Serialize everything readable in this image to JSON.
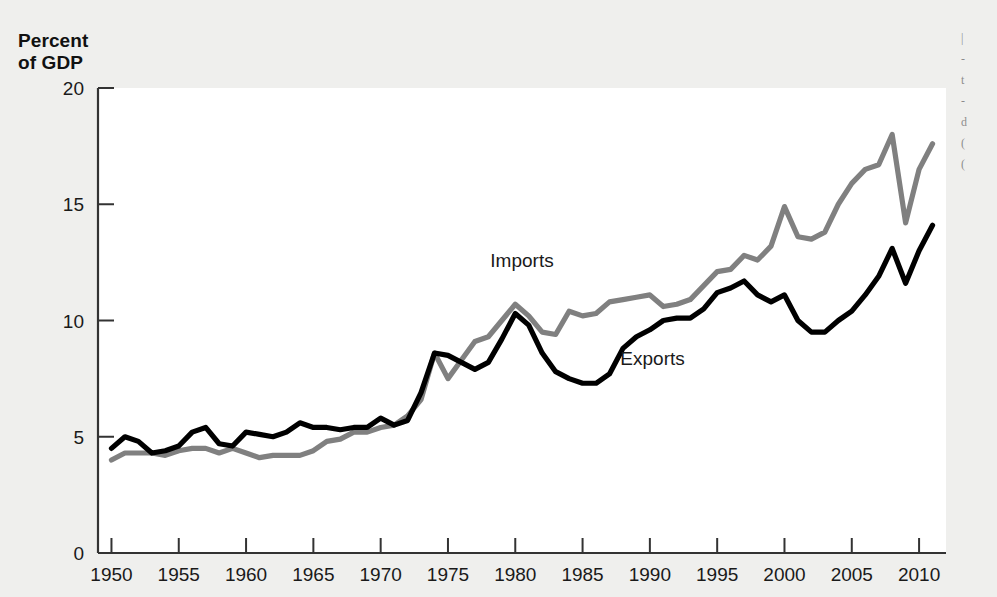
{
  "figure": {
    "axis_title": "Percent\nof GDP",
    "background_color": "#efefed",
    "plot_background_color": "#ffffff"
  },
  "chart_data": {
    "type": "line",
    "title": "",
    "subtitle": "",
    "xlabel": "",
    "ylabel": "Percent of GDP",
    "xlim": [
      1949,
      2012
    ],
    "ylim": [
      0,
      20
    ],
    "grid": false,
    "legend_position": "inline-annotation",
    "xticks": [
      1950,
      1955,
      1960,
      1965,
      1970,
      1975,
      1980,
      1985,
      1990,
      1995,
      2000,
      2005,
      2010
    ],
    "xtick_labels": [
      "1950",
      "1955",
      "1960",
      "1965",
      "1970",
      "1975",
      "1980",
      "1985",
      "1990",
      "1995",
      "2000",
      "2005",
      "2010"
    ],
    "yticks": [
      0,
      5,
      10,
      15,
      20
    ],
    "ytick_labels": [
      "0",
      "5",
      "10",
      "15",
      "20"
    ],
    "x": [
      1950,
      1951,
      1952,
      1953,
      1954,
      1955,
      1956,
      1957,
      1958,
      1959,
      1960,
      1961,
      1962,
      1963,
      1964,
      1965,
      1966,
      1967,
      1968,
      1969,
      1970,
      1971,
      1972,
      1973,
      1974,
      1975,
      1976,
      1977,
      1978,
      1979,
      1980,
      1981,
      1982,
      1983,
      1984,
      1985,
      1986,
      1987,
      1988,
      1989,
      1990,
      1991,
      1992,
      1993,
      1994,
      1995,
      1996,
      1997,
      1998,
      1999,
      2000,
      2001,
      2002,
      2003,
      2004,
      2005,
      2006,
      2007,
      2008,
      2009,
      2010,
      2011
    ],
    "series": [
      {
        "name": "Imports",
        "color": "#808080",
        "label_x": 1980.5,
        "label_y": 12.3,
        "values": [
          4.0,
          4.3,
          4.3,
          4.3,
          4.2,
          4.4,
          4.5,
          4.5,
          4.3,
          4.5,
          4.3,
          4.1,
          4.2,
          4.2,
          4.2,
          4.4,
          4.8,
          4.9,
          5.2,
          5.2,
          5.4,
          5.5,
          5.9,
          6.6,
          8.6,
          7.5,
          8.3,
          9.1,
          9.3,
          10.0,
          10.7,
          10.2,
          9.5,
          9.4,
          10.4,
          10.2,
          10.3,
          10.8,
          10.9,
          11.0,
          11.1,
          10.6,
          10.7,
          10.9,
          11.5,
          12.1,
          12.2,
          12.8,
          12.6,
          13.2,
          14.9,
          13.6,
          13.5,
          13.8,
          15.0,
          15.9,
          16.5,
          16.7,
          18.0,
          14.2,
          16.5,
          17.6
        ]
      },
      {
        "name": "Exports",
        "color": "#000000",
        "label_x": 1990.2,
        "label_y": 8.1,
        "values": [
          4.5,
          5.0,
          4.8,
          4.3,
          4.4,
          4.6,
          5.2,
          5.4,
          4.7,
          4.6,
          5.2,
          5.1,
          5.0,
          5.2,
          5.6,
          5.4,
          5.4,
          5.3,
          5.4,
          5.4,
          5.8,
          5.5,
          5.7,
          6.9,
          8.6,
          8.5,
          8.2,
          7.9,
          8.2,
          9.2,
          10.3,
          9.8,
          8.6,
          7.8,
          7.5,
          7.3,
          7.3,
          7.7,
          8.8,
          9.3,
          9.6,
          10.0,
          10.1,
          10.1,
          10.5,
          11.2,
          11.4,
          11.7,
          11.1,
          10.8,
          11.1,
          10.0,
          9.5,
          9.5,
          10.0,
          10.4,
          11.1,
          11.9,
          13.1,
          11.6,
          13.0,
          14.1
        ]
      }
    ]
  },
  "edge_fragment": {
    "lines": "|\n-\nt\n-\nd\n(\n("
  }
}
